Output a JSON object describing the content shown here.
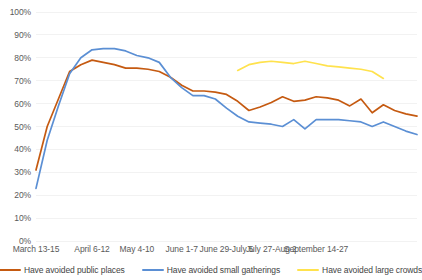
{
  "chart_data": {
    "type": "line",
    "title": "",
    "xlabel": "",
    "ylabel": "",
    "ylim": [
      0,
      100
    ],
    "grid": true,
    "legend_position": "bottom",
    "y_ticks": [
      "0%",
      "10%",
      "20%",
      "30%",
      "40%",
      "50%",
      "60%",
      "70%",
      "80%",
      "90%",
      "100%"
    ],
    "y_tick_values": [
      0,
      10,
      20,
      30,
      40,
      50,
      60,
      70,
      80,
      90,
      100
    ],
    "x_tick_labels": [
      "March 13-15",
      "April 6-12",
      "May 4-10",
      "June 1-7",
      "June 29-July 5",
      "July 27-Aug 2",
      "September 14-27"
    ],
    "x_tick_indices": [
      0,
      5,
      9,
      13,
      17,
      21,
      25
    ],
    "x_count": 27,
    "series": [
      {
        "name": "Have avoided public places",
        "color": "#C55A11",
        "values": [
          31,
          50,
          62,
          74,
          77,
          79,
          78,
          77,
          75.5,
          75.5,
          75,
          74,
          71.5,
          68,
          65.5,
          65.5,
          65,
          64,
          61,
          57,
          58.5,
          60.5,
          63,
          61,
          61.5,
          63,
          62.5,
          61.5,
          59,
          62,
          56,
          59.5,
          57,
          55.5,
          54.5
        ]
      },
      {
        "name": "Have avoided small gatherings",
        "color": "#5B8FD4",
        "values": [
          23,
          44,
          59,
          73,
          80,
          83.5,
          84,
          84,
          83,
          81,
          80,
          78,
          71.5,
          67,
          63.5,
          63.5,
          62,
          58,
          54.5,
          52,
          51.5,
          51,
          50,
          53,
          49,
          53,
          53,
          53,
          52.5,
          52,
          50,
          52,
          50,
          48,
          46.5
        ]
      },
      {
        "name": "Have avoided large crowds",
        "color": "#FFE24D",
        "start_index": 18,
        "values": [
          74.5,
          77,
          78,
          78.5,
          78,
          77.5,
          78.5,
          77.5,
          76.5,
          76,
          75.5,
          75,
          74,
          71
        ]
      }
    ]
  },
  "legend": {
    "items": [
      {
        "label": "Have avoided public places",
        "color": "#C55A11"
      },
      {
        "label": "Have avoided small gatherings",
        "color": "#5B8FD4"
      },
      {
        "label": "Have avoided large crowds",
        "color": "#FFE24D"
      }
    ]
  }
}
